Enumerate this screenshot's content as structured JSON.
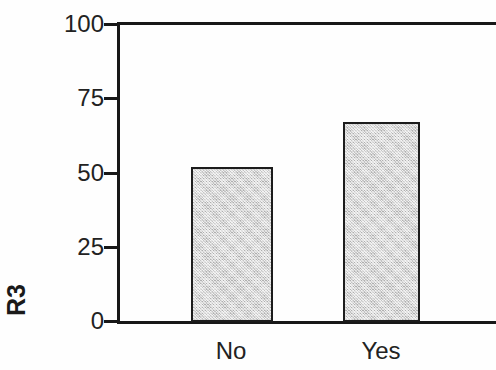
{
  "chart": {
    "y_axis_label": "R3",
    "ytick_labels": [
      "100",
      "75",
      "50",
      "25",
      "0"
    ],
    "xtick_labels": [
      "No",
      "Yes"
    ],
    "bar_fill_color": "#cbcbcb",
    "bar_edge_color": "#1c1c1c",
    "axis_color": "#181818",
    "background_color": "#ffffff"
  },
  "chart_data": {
    "type": "bar",
    "title": "",
    "subtitle": "",
    "categories": [
      "No",
      "Yes"
    ],
    "values": [
      52,
      67
    ],
    "xlabel": "",
    "ylabel": "R3",
    "ylim": [
      0,
      100
    ],
    "yticks": [
      0,
      25,
      50,
      75,
      100
    ],
    "grid": false,
    "legend": false,
    "legend_position": "none",
    "series": [
      {
        "name": "R3",
        "values": [
          52,
          67
        ]
      }
    ],
    "annotations": []
  }
}
